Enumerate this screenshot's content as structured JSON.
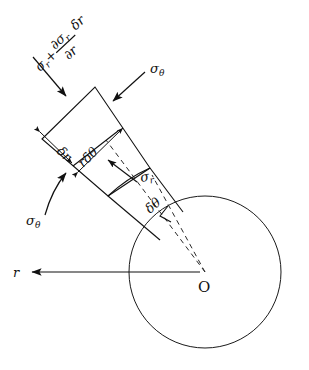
{
  "figure": {
    "center_point_label": "O",
    "radial_axis_label": "r",
    "labels": {
      "outer_radial_stress": {
        "base": "σ",
        "base_sub": "r",
        "plus": "+",
        "numerator": "∂σ",
        "numerator_sub": "r",
        "denominator": "∂r",
        "multiplier": "δr"
      },
      "inner_radial_stress": {
        "base": "σ",
        "sub": "r"
      },
      "hoop_stress_upper": {
        "base": "σ",
        "sub": "θ"
      },
      "hoop_stress_lower": {
        "base": "σ",
        "sub": "θ"
      },
      "radial_thickness": "δr",
      "arc_length": "rδθ",
      "included_angle": "δθ"
    }
  },
  "geometry": {
    "circle": {
      "cx": 205,
      "cy": 272,
      "r": 76
    },
    "element": {
      "inner_left": 108,
      "inner_right": 150,
      "outer_left": 42,
      "outer_right": 95
    },
    "r_axis": {
      "from_x": 200,
      "to_x": 30,
      "y": 272
    }
  },
  "colors": {
    "ink": "#111111",
    "background": "#ffffff"
  }
}
